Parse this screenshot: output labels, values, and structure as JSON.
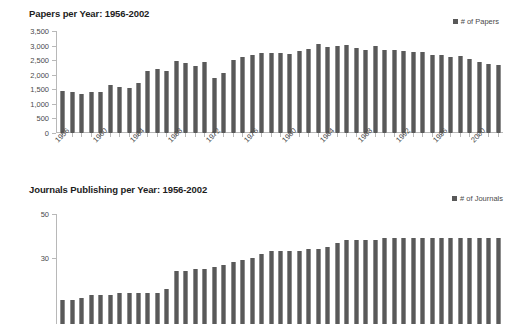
{
  "chart_data": [
    {
      "type": "bar",
      "name": "papers-per-year",
      "title": "Papers per Year: 1956-2002",
      "xlabel": "",
      "ylabel": "",
      "legend": {
        "label": "# of Papers",
        "marker": "square-marker",
        "position": "top-right"
      },
      "grid": false,
      "ylim": [
        0,
        3500
      ],
      "yticks": [
        3500,
        3000,
        2500,
        2000,
        1500,
        1000,
        500,
        0
      ],
      "ytick_labels": [
        "3,500",
        "3,000",
        "2,500",
        "2,000",
        "1,500",
        "1,000",
        "500",
        "0"
      ],
      "xtick_labels": [
        "1956",
        "1960",
        "1964",
        "1968",
        "1972",
        "1976",
        "1980",
        "1984",
        "1988",
        "1992",
        "1996",
        "2000"
      ],
      "xtick_interval": 4,
      "categories": [
        "1956",
        "1957",
        "1958",
        "1959",
        "1960",
        "1961",
        "1962",
        "1963",
        "1964",
        "1965",
        "1966",
        "1967",
        "1968",
        "1969",
        "1970",
        "1971",
        "1972",
        "1973",
        "1974",
        "1975",
        "1976",
        "1977",
        "1978",
        "1979",
        "1980",
        "1981",
        "1982",
        "1983",
        "1984",
        "1985",
        "1986",
        "1987",
        "1988",
        "1989",
        "1990",
        "1991",
        "1992",
        "1993",
        "1994",
        "1995",
        "1996",
        "1997",
        "1998",
        "1999",
        "2000",
        "2001",
        "2002"
      ],
      "values": [
        1440,
        1400,
        1330,
        1420,
        1420,
        1650,
        1590,
        1550,
        1720,
        2140,
        2190,
        2120,
        2470,
        2390,
        2290,
        2450,
        1890,
        2050,
        2500,
        2610,
        2680,
        2730,
        2730,
        2760,
        2720,
        2800,
        2890,
        3050,
        2940,
        3000,
        3020,
        2930,
        2850,
        2980,
        2850,
        2860,
        2800,
        2780,
        2770,
        2670,
        2660,
        2620,
        2650,
        2540,
        2450,
        2360,
        2320
      ],
      "bar_color": "#595959"
    },
    {
      "type": "bar",
      "name": "journals-publishing-per-year",
      "title": "Journals Publishing per Year: 1956-2002",
      "xlabel": "",
      "ylabel": "",
      "legend": {
        "label": "# of Journals",
        "marker": "square-marker",
        "position": "top-right"
      },
      "grid": false,
      "ylim": [
        0,
        50
      ],
      "yticks": [
        50,
        30
      ],
      "ytick_labels": [
        "50",
        "30"
      ],
      "xtick_labels": [],
      "xtick_interval": 4,
      "cropped": "bottom of chart cut off by screenshot edge",
      "categories": [
        "1956",
        "1957",
        "1958",
        "1959",
        "1960",
        "1961",
        "1962",
        "1963",
        "1964",
        "1965",
        "1966",
        "1967",
        "1968",
        "1969",
        "1970",
        "1971",
        "1972",
        "1973",
        "1974",
        "1975",
        "1976",
        "1977",
        "1978",
        "1979",
        "1980",
        "1981",
        "1982",
        "1983",
        "1984",
        "1985",
        "1986",
        "1987",
        "1988",
        "1989",
        "1990",
        "1991",
        "1992",
        "1993",
        "1994",
        "1995",
        "1996",
        "1997",
        "1998",
        "1999",
        "2000",
        "2001",
        "2002"
      ],
      "values": [
        11,
        11,
        12,
        13,
        13,
        13,
        14,
        14,
        14,
        14,
        14,
        16,
        24,
        24,
        25,
        25,
        26,
        27,
        28,
        29,
        30,
        32,
        33,
        33,
        33,
        33,
        34,
        34,
        35,
        37,
        38,
        38,
        38,
        38,
        39,
        39,
        39,
        39,
        39,
        39,
        39,
        39,
        39,
        39,
        39,
        39,
        39
      ],
      "bar_color": "#595959"
    }
  ]
}
